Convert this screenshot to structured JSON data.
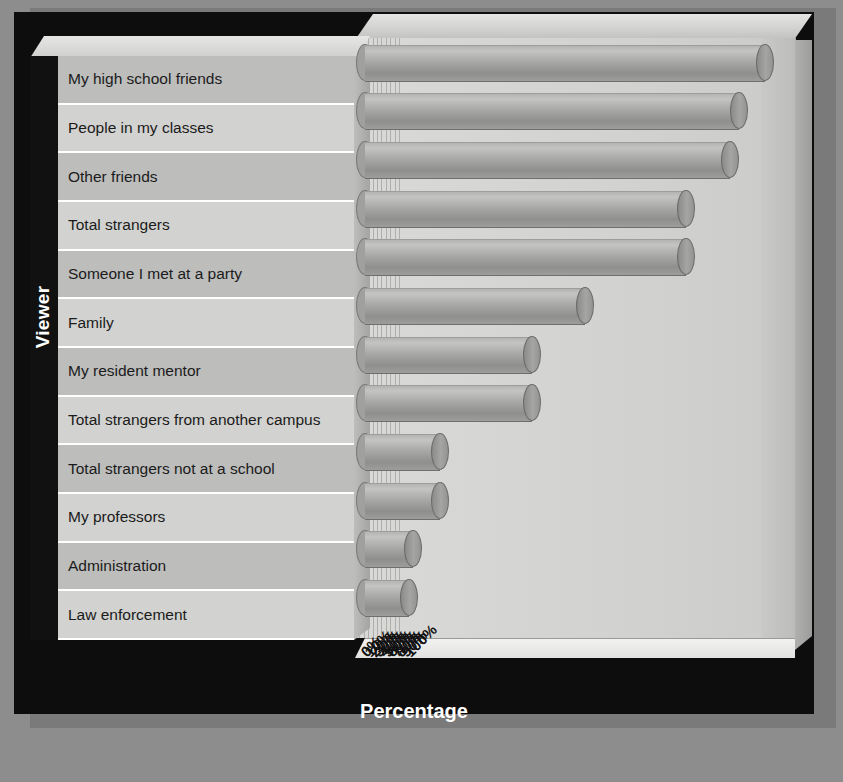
{
  "chart_data": {
    "type": "bar",
    "orientation": "horizontal",
    "title": "",
    "xlabel": "Percentage",
    "ylabel": "Viewer",
    "xlim": [
      0,
      100
    ],
    "xticks": [
      "0%",
      "10%",
      "20%",
      "30%",
      "40%",
      "50%",
      "60%",
      "70%",
      "80%",
      "90%",
      "100%"
    ],
    "grid": true,
    "legend": "none",
    "categories": [
      "My high school friends",
      "People in my classes",
      "Other friends",
      "Total strangers",
      "Someone I met at a party",
      "Family",
      "My resident mentor",
      "Total strangers from another campus",
      "Total strangers not at a school",
      "My professors",
      "Administration",
      "Law enforcement"
    ],
    "values": [
      91,
      85,
      83,
      73,
      73,
      50,
      38,
      38,
      17,
      17,
      11,
      10
    ],
    "unit": "%"
  },
  "axes": {
    "y_title": "Viewer",
    "x_title": "Percentage"
  },
  "colors": {
    "frame": "#0d0d0d",
    "background": "#8d8d8d",
    "bar": "#a8a8a6",
    "panel": "#c9c9c7",
    "label_text": "#1b1b1b",
    "title_text": "#ffffff"
  }
}
